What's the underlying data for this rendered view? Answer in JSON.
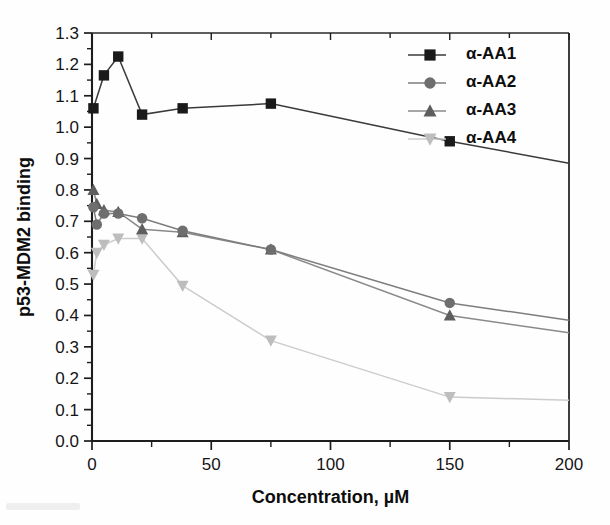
{
  "chart_data": {
    "type": "line",
    "title": "",
    "xlabel": "Concentration, µM",
    "ylabel": "p53-MDM2 binding",
    "xlim": [
      0,
      200
    ],
    "ylim": [
      0.0,
      1.3
    ],
    "xticks": [
      0,
      50,
      100,
      150,
      200
    ],
    "xticklabels": [
      "0",
      "50",
      "100",
      "150",
      "200"
    ],
    "yticks": [
      0.0,
      0.1,
      0.2,
      0.3,
      0.4,
      0.5,
      0.6,
      0.7,
      0.8,
      0.9,
      1.0,
      1.1,
      1.2,
      1.3
    ],
    "yticklabels": [
      "0.0",
      "0.1",
      "0.2",
      "0.3",
      "0.4",
      "0.5",
      "0.6",
      "0.7",
      "0.8",
      "0.9",
      "1.0",
      "1.1",
      "1.2",
      "1.3"
    ],
    "grid": false,
    "legend_position": "top-right",
    "series": [
      {
        "name": "α-AA1",
        "marker": "square",
        "color": "#1a1a1a",
        "line_color": "#3a3a3a",
        "x": [
          0.6,
          5,
          11,
          21,
          38,
          75,
          150,
          200
        ],
        "y": [
          1.06,
          1.165,
          1.225,
          1.04,
          1.06,
          1.075,
          0.955,
          0.885
        ]
      },
      {
        "name": "α-AA2",
        "marker": "circle",
        "color": "#6e6e6e",
        "line_color": "#7d7d7d",
        "x": [
          0.6,
          2,
          5,
          11,
          21,
          38,
          75,
          150,
          200
        ],
        "y": [
          0.745,
          0.69,
          0.725,
          0.725,
          0.71,
          0.67,
          0.61,
          0.44,
          0.385
        ]
      },
      {
        "name": "α-AA3",
        "marker": "triangle-up",
        "color": "#5e5e5e",
        "line_color": "#8a8a8a",
        "x": [
          0.6,
          2,
          5,
          11,
          21,
          38,
          75,
          150,
          200
        ],
        "y": [
          0.8,
          0.755,
          0.735,
          0.73,
          0.675,
          0.665,
          0.61,
          0.4,
          0.345
        ]
      },
      {
        "name": "α-AA4",
        "marker": "triangle-down",
        "color": "#bdbdbd",
        "line_color": "#cccccc",
        "x": [
          0.6,
          2,
          5,
          11,
          21,
          38,
          75,
          150,
          200
        ],
        "y": [
          0.53,
          0.6,
          0.625,
          0.645,
          0.645,
          0.495,
          0.32,
          0.14,
          0.13
        ]
      }
    ]
  }
}
